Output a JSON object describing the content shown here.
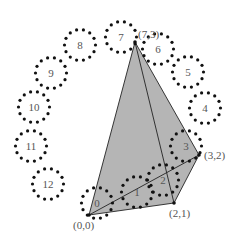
{
  "diagram": {
    "type": "geometric-construction",
    "colors": {
      "fill": "#b5b5b5",
      "stroke": "#222222",
      "dots": "#111111",
      "text": "#555555"
    },
    "circles": [
      {
        "label": "0",
        "cx": 97,
        "cy": 203
      },
      {
        "label": "1",
        "cx": 137,
        "cy": 192
      },
      {
        "label": "2",
        "cx": 163,
        "cy": 180
      },
      {
        "label": "3",
        "cx": 186,
        "cy": 146
      },
      {
        "label": "4",
        "cx": 205,
        "cy": 108
      },
      {
        "label": "5",
        "cx": 188,
        "cy": 72
      },
      {
        "label": "6",
        "cx": 158,
        "cy": 49
      },
      {
        "label": "7",
        "cx": 121,
        "cy": 37
      },
      {
        "label": "8",
        "cx": 80,
        "cy": 45
      },
      {
        "label": "9",
        "cx": 51,
        "cy": 73
      },
      {
        "label": "10",
        "cx": 34,
        "cy": 107
      },
      {
        "label": "11",
        "cx": 31,
        "cy": 146
      },
      {
        "label": "12",
        "cx": 48,
        "cy": 184
      }
    ],
    "points": {
      "p00": {
        "label": "(0,0)",
        "x": 89,
        "y": 215
      },
      "p21": {
        "label": "(2,1)",
        "x": 174,
        "y": 203
      },
      "p32": {
        "label": "(3,2)",
        "x": 199,
        "y": 155
      },
      "p73": {
        "label": "(7,3)",
        "x": 135,
        "y": 42
      }
    }
  }
}
